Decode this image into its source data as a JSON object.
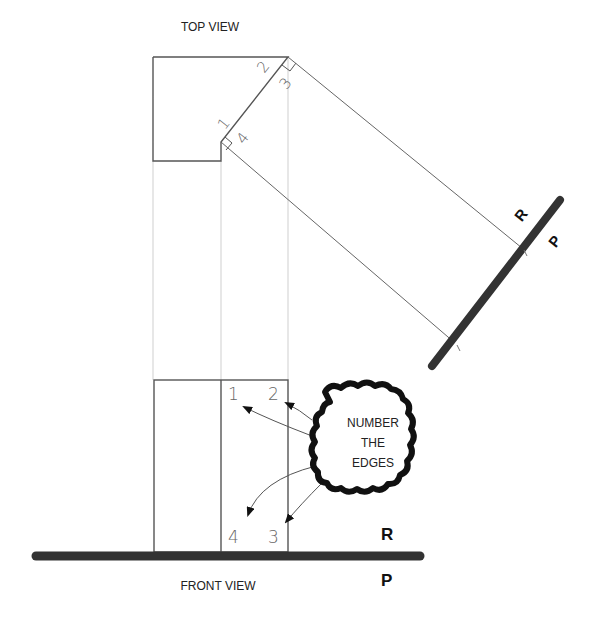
{
  "labels": {
    "top_view": "TOP VIEW",
    "front_view": "FRONT VIEW",
    "cloud_line1": "NUMBER",
    "cloud_line2": "THE",
    "cloud_line3": "EDGES"
  },
  "fold_lines": {
    "auxiliary": {
      "upper": "R",
      "lower": "P"
    },
    "front": {
      "upper": "R",
      "lower": "P"
    }
  },
  "top_view_edge_numbers": [
    "1",
    "2",
    "3",
    "4"
  ],
  "front_view_edge_numbers": [
    "1",
    "2",
    "3",
    "4"
  ],
  "colors": {
    "outline": "#555555",
    "projection": "#cccccc",
    "fold_line": "#333333"
  }
}
